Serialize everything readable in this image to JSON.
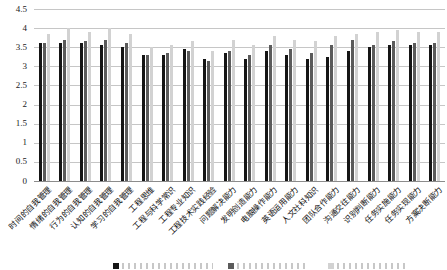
{
  "chart_data": {
    "type": "bar",
    "categories": [
      "时间的自我管理",
      "情绪的自我管理",
      "行为的自我管理",
      "认知的自我管理",
      "学习的自我管理",
      "工程思维",
      "工程与科学常识",
      "工程专业知识",
      "工程技术实践经验",
      "问题解决能力",
      "发明创造能力",
      "电脑操作能力",
      "英语运用能力",
      "人文社科知识",
      "团队合作能力",
      "沟通交往能力",
      "识别判断能力",
      "任务实施能力",
      "任务实现能力",
      "方案决断能力"
    ],
    "series": [
      {
        "name": "",
        "color": "#151515",
        "values": [
          3.6,
          3.6,
          3.6,
          3.55,
          3.5,
          3.3,
          3.3,
          3.45,
          3.2,
          3.35,
          3.2,
          3.4,
          3.3,
          3.2,
          3.25,
          3.4,
          3.5,
          3.55,
          3.55,
          3.55
        ]
      },
      {
        "name": "",
        "color": "#5b5b5b",
        "values": [
          3.6,
          3.7,
          3.65,
          3.7,
          3.6,
          3.3,
          3.35,
          3.4,
          3.15,
          3.4,
          3.3,
          3.55,
          3.45,
          3.35,
          3.55,
          3.7,
          3.55,
          3.65,
          3.6,
          3.6
        ]
      },
      {
        "name": "",
        "color": "#d2d2d2",
        "values": [
          3.85,
          4.0,
          3.9,
          4.0,
          3.85,
          3.5,
          3.55,
          3.65,
          3.4,
          3.7,
          3.55,
          3.8,
          3.7,
          3.65,
          3.8,
          3.85,
          3.9,
          3.95,
          3.9,
          3.9
        ]
      }
    ],
    "ylim": [
      0,
      4.5
    ],
    "ytick_step": 0.5,
    "ytick_labels": [
      "0",
      "0.5",
      "1",
      "1.5",
      "2",
      "2.5",
      "3",
      "3.5",
      "4",
      "4.5"
    ],
    "xlabel": "",
    "ylabel": "",
    "grid": true,
    "legend": {
      "position": "bottom",
      "clipped": true,
      "entries": [
        "",
        "",
        ""
      ]
    }
  }
}
